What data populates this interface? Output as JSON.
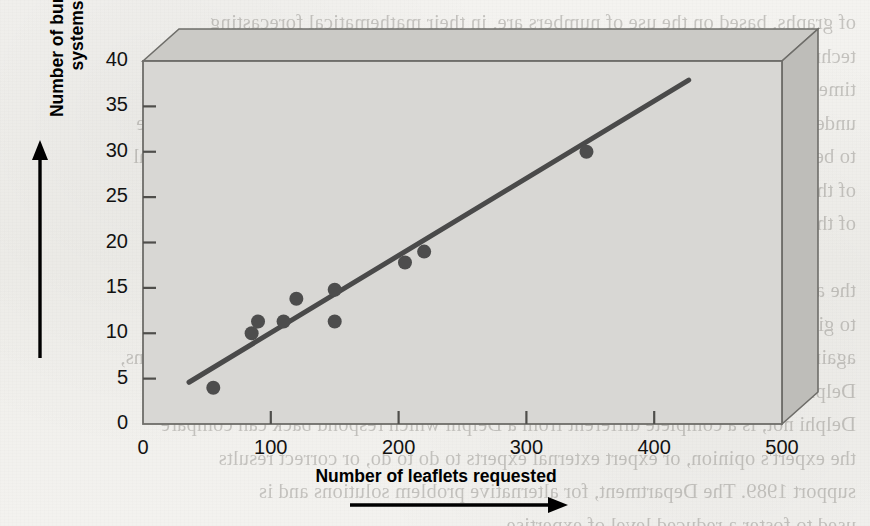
{
  "page": {
    "background_color": "#f2f1ee",
    "bleed_through_lines": [
      "of graphs, based on the use of numbers are, in their mathematical forecasting",
      "techniques, inevitably more accurate or less accurate",
      "time-series or regression-based forecasting because of the emphasis on the",
      "underlying cause, not on some past sales or requirements data applied mapping future",
      "to be developed pass or future or causal non-statistical approach. Though not a typical",
      "of the technique or the use of it, this interpretation may be used as a key",
      "of the survey's need.",
      "",
      "the alternative. The Delphi method involves a panel of experts who are",
      "to give an answer to the Delphi method. The experts are then asked those",
      "again. Delphi again to another partial problem, we will never a comparison of opinions,",
      "Delphi and its method was developed by another organisation TQM,",
      "Delphi not, is a complete different from a Delphi which respond back can compare",
      "the expert's opinion, or expert external experts to do to do, or correct results",
      "support 1989. The Department, for alternative problem solutions and is",
      "used to foster a reduced level of expertise."
    ]
  },
  "chart_data": {
    "type": "scatter",
    "title": "",
    "xlabel": "Number of leaflets requested",
    "ylabel": "Number of burglar alarm\nsystems sold",
    "xlim": [
      0,
      500
    ],
    "ylim": [
      0,
      40
    ],
    "xticks": [
      0,
      100,
      200,
      300,
      400,
      500
    ],
    "xtick_labels": [
      "0",
      "100",
      "200",
      "300",
      "400",
      "500"
    ],
    "yticks": [
      0,
      5,
      10,
      15,
      20,
      25,
      30,
      35,
      40
    ],
    "ytick_labels": [
      "0",
      "5",
      "10",
      "15",
      "20",
      "25",
      "30",
      "35",
      "40"
    ],
    "grid": false,
    "legend": null,
    "points": [
      {
        "x": 55,
        "y": 4.0
      },
      {
        "x": 85,
        "y": 10.0
      },
      {
        "x": 90,
        "y": 11.3
      },
      {
        "x": 110,
        "y": 11.3
      },
      {
        "x": 120,
        "y": 13.8
      },
      {
        "x": 150,
        "y": 14.8
      },
      {
        "x": 150,
        "y": 11.3
      },
      {
        "x": 205,
        "y": 17.8
      },
      {
        "x": 220,
        "y": 19.0
      },
      {
        "x": 347,
        "y": 30.0
      }
    ],
    "point_color": "#4d4d4d",
    "point_radius_px": 7,
    "trendline": {
      "type": "line-of-best-fit",
      "x_start": 36,
      "y_start": 4.6,
      "x_end": 427,
      "y_end": 37.9,
      "color": "#4a4a4a",
      "width_px": 5
    },
    "plot_area_fill": "#d8d7d4",
    "frame_style": "3d-box",
    "frame_top_fill": "#cbcac6",
    "frame_right_fill": "#bebdb9",
    "x_axis_arrow": true,
    "y_axis_arrow": true
  }
}
